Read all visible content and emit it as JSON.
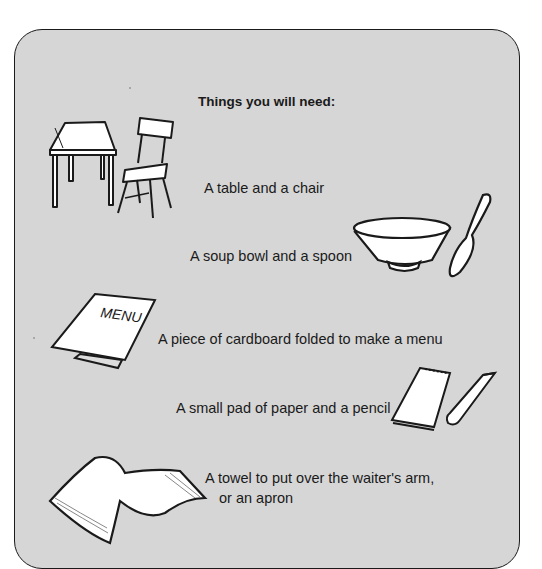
{
  "page": {
    "heading": "Things you will need:",
    "items": [
      {
        "label": "A table and a chair",
        "icon": "table-chair-icon"
      },
      {
        "label": "A soup bowl and a spoon",
        "icon": "bowl-spoon-icon"
      },
      {
        "label": "A piece of cardboard folded to make a menu",
        "icon": "menu-card-icon",
        "menu_text": "MENU"
      },
      {
        "label": "A small pad of paper and a pencil",
        "icon": "notepad-pencil-icon"
      },
      {
        "label_line1": "A towel to put over the waiter's arm,",
        "label_line2": "or an apron",
        "icon": "towel-icon"
      }
    ]
  },
  "colors": {
    "panel": "#d6d6d6",
    "ink": "#1a1a1a",
    "paper": "#ffffff"
  }
}
